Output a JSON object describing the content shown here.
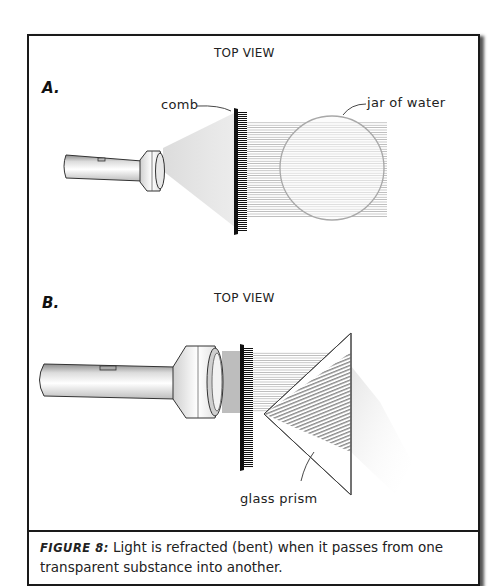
{
  "figure": {
    "panels": [
      {
        "letter": "A.",
        "view_title": "TOP VIEW",
        "labels": {
          "comb": "comb",
          "target": "jar of water"
        }
      },
      {
        "letter": "B.",
        "view_title": "TOP VIEW",
        "labels": {
          "target": "glass prism"
        }
      }
    ],
    "caption": {
      "figure_label": "FIGURE 8:",
      "text": " Light is refracted (bent) when it passes from one transparent substance into another."
    },
    "colors": {
      "frame": "#1a1a1a",
      "beam": "#cfcfcf",
      "ray": "#9a9a9a",
      "jar_outline": "#a8a8a8",
      "prism_outline": "#444444"
    }
  }
}
